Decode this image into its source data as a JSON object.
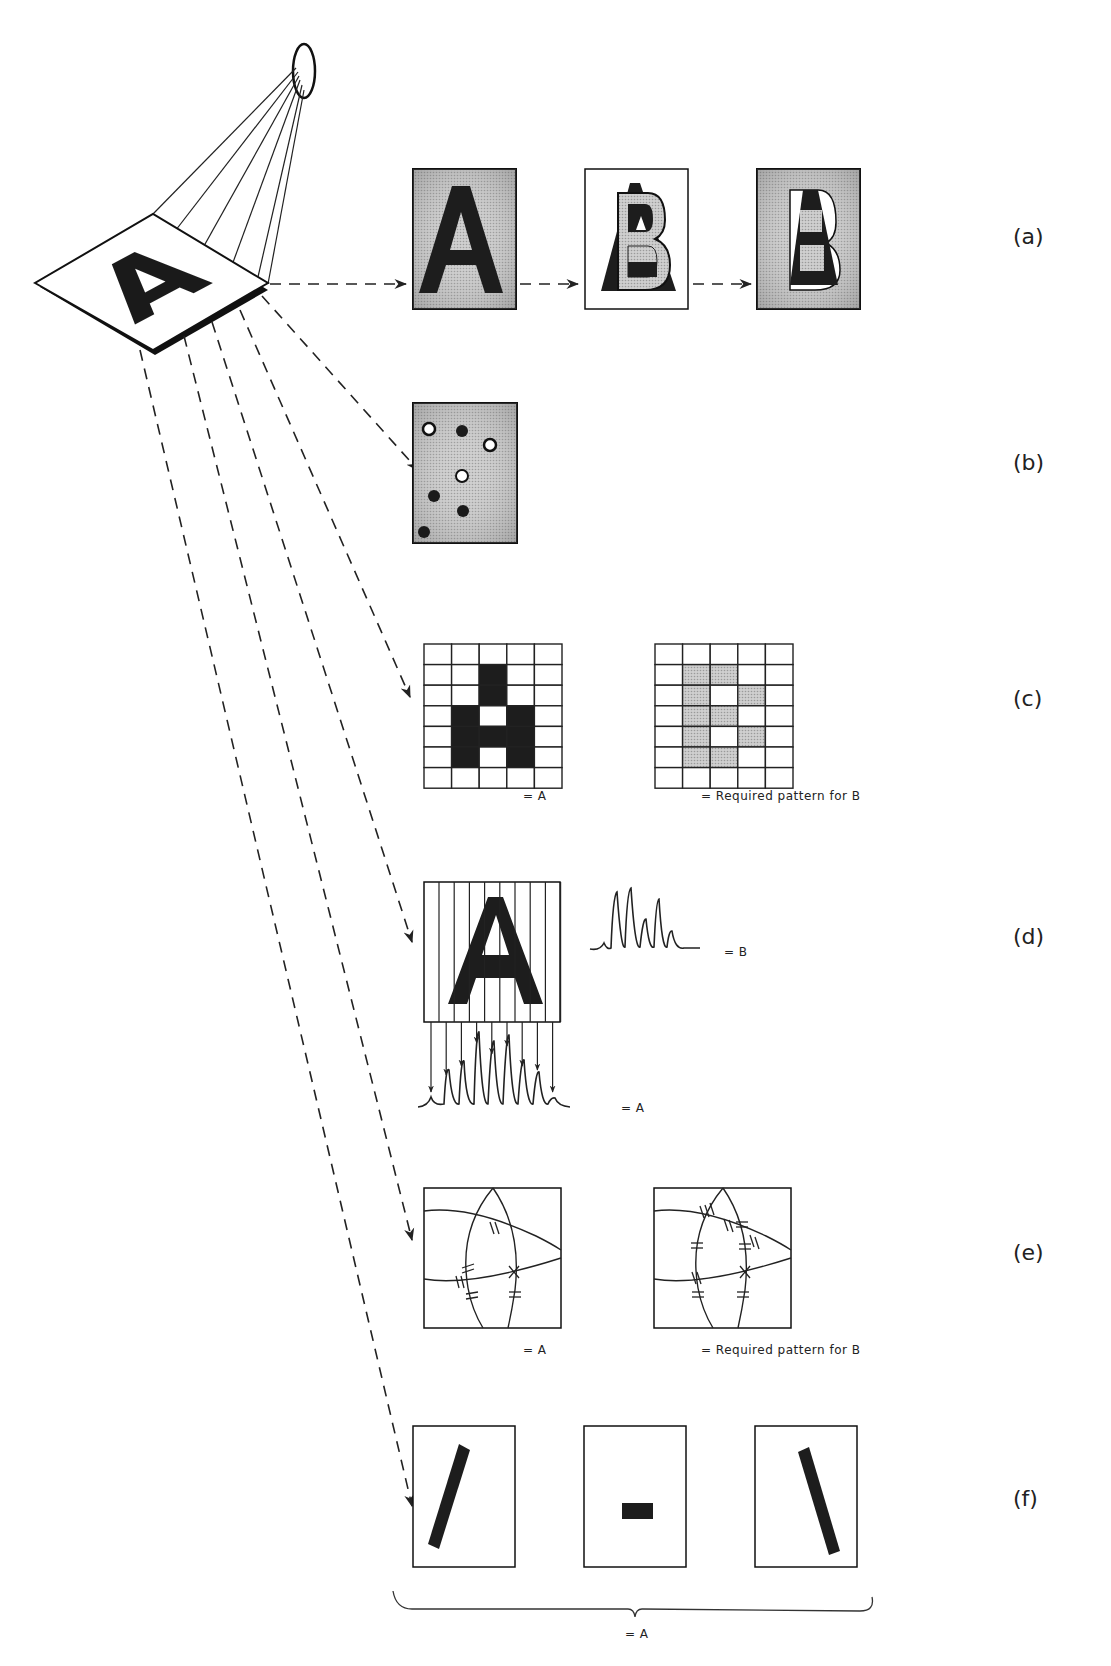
{
  "diagram": {
    "source_card": {
      "letter": "A"
    },
    "rows": [
      {
        "id": "a",
        "label": "(a)",
        "description": "template matching",
        "panels": [
          "A",
          "B",
          "A over B overlay"
        ]
      },
      {
        "id": "b",
        "label": "(b)",
        "description": "sampled point pattern",
        "points": [
          {
            "x": 0.15,
            "y": 0.17,
            "kind": "open"
          },
          {
            "x": 0.47,
            "y": 0.19,
            "kind": "filled"
          },
          {
            "x": 0.75,
            "y": 0.29,
            "kind": "open"
          },
          {
            "x": 0.47,
            "y": 0.48,
            "kind": "open"
          },
          {
            "x": 0.2,
            "y": 0.63,
            "kind": "filled"
          },
          {
            "x": 0.48,
            "y": 0.75,
            "kind": "filled"
          },
          {
            "x": 0.1,
            "y": 0.93,
            "kind": "filled"
          }
        ]
      },
      {
        "id": "c",
        "label": "(c)",
        "description": "5x7 grid coding",
        "grid_cols": 5,
        "grid_rows": 7,
        "grid_A": [
          [
            0,
            0,
            0,
            0,
            0
          ],
          [
            0,
            0,
            1,
            0,
            0
          ],
          [
            0,
            0,
            1,
            0,
            0
          ],
          [
            0,
            1,
            0,
            1,
            0
          ],
          [
            0,
            1,
            1,
            1,
            0
          ],
          [
            0,
            1,
            0,
            1,
            0
          ],
          [
            0,
            0,
            0,
            0,
            0
          ]
        ],
        "grid_B": [
          [
            0,
            0,
            0,
            0,
            0
          ],
          [
            0,
            1,
            1,
            0,
            0
          ],
          [
            0,
            1,
            0,
            1,
            0
          ],
          [
            0,
            1,
            1,
            0,
            0
          ],
          [
            0,
            1,
            0,
            1,
            0
          ],
          [
            0,
            1,
            1,
            0,
            0
          ],
          [
            0,
            0,
            0,
            0,
            0
          ]
        ],
        "caption_left": "= A",
        "caption_right": "= Required pattern for B"
      },
      {
        "id": "d",
        "label": "(d)",
        "description": "scan line waveform",
        "caption_B": "= B",
        "caption_A": "= A"
      },
      {
        "id": "e",
        "label": "(e)",
        "description": "intersection feature pattern",
        "caption_left": "= A",
        "caption_right": "= Required pattern for B"
      },
      {
        "id": "f",
        "label": "(f)",
        "description": "stroke decomposition",
        "strokes": [
          "left diagonal",
          "horizontal bar",
          "right diagonal"
        ],
        "brace_caption": "= A"
      }
    ]
  }
}
